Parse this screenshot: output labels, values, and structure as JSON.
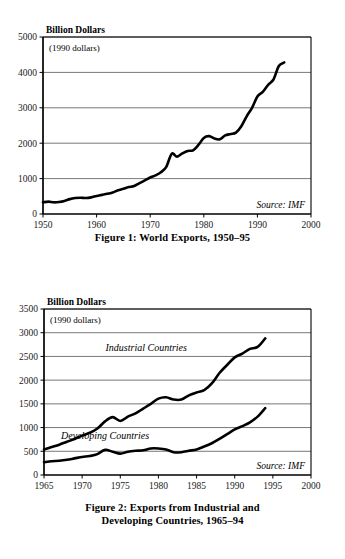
{
  "page": {
    "background": "#ffffff",
    "ink": "#000000",
    "gridline_color": "#555555",
    "line_color": "#000000"
  },
  "figures": [
    {
      "id": "figure-1",
      "caption": "Figure 1: World Exports, 1950–95",
      "chart_data": {
        "type": "line",
        "title": "",
        "ylabel": "Billion Dollars",
        "xlabel": "",
        "note": "(1990 dollars)",
        "source": "Source: IMF",
        "grid": true,
        "legend": "none",
        "xlim": [
          1950,
          2000
        ],
        "ylim": [
          0,
          5000
        ],
        "xticks": [
          1950,
          1960,
          1970,
          1980,
          1990,
          2000
        ],
        "yticks": [
          0,
          1000,
          2000,
          3000,
          4000,
          5000
        ],
        "series": [
          {
            "name": "World Exports",
            "x": [
              1950,
              1951,
              1952,
              1953,
              1954,
              1955,
              1956,
              1957,
              1958,
              1959,
              1960,
              1961,
              1962,
              1963,
              1964,
              1965,
              1966,
              1967,
              1968,
              1969,
              1970,
              1971,
              1972,
              1973,
              1974,
              1975,
              1976,
              1977,
              1978,
              1979,
              1980,
              1981,
              1982,
              1983,
              1984,
              1985,
              1986,
              1987,
              1988,
              1989,
              1990,
              1991,
              1992,
              1993,
              1994,
              1995
            ],
            "values": [
              330,
              350,
              330,
              340,
              370,
              420,
              450,
              460,
              450,
              470,
              510,
              540,
              570,
              610,
              670,
              710,
              760,
              790,
              870,
              950,
              1030,
              1090,
              1180,
              1330,
              1700,
              1620,
              1710,
              1780,
              1800,
              1950,
              2150,
              2200,
              2130,
              2110,
              2220,
              2260,
              2300,
              2480,
              2760,
              3000,
              3320,
              3450,
              3650,
              3800,
              4180,
              4280
            ]
          }
        ]
      }
    },
    {
      "id": "figure-2",
      "caption_line_1": "Figure 2: Exports from Industrial and",
      "caption_line_2": "Developing Countries, 1965–94",
      "chart_data": {
        "type": "line",
        "title": "",
        "ylabel": "Billion Dollars",
        "xlabel": "",
        "note": "(1990 dollars)",
        "source": "Source: IMF",
        "grid": true,
        "legend": "inline-labels",
        "xlim": [
          1965,
          2000
        ],
        "ylim": [
          0,
          3500
        ],
        "xticks": [
          1965,
          1970,
          1975,
          1980,
          1985,
          1990,
          1995,
          2000
        ],
        "yticks": [
          0,
          500,
          1000,
          1500,
          2000,
          2500,
          3000,
          3500
        ],
        "series": [
          {
            "name": "Industrial Countries",
            "label_x": 1978.4,
            "label_y": 2620,
            "x": [
              1965,
              1966,
              1967,
              1968,
              1969,
              1970,
              1971,
              1972,
              1973,
              1974,
              1975,
              1976,
              1977,
              1978,
              1979,
              1980,
              1981,
              1982,
              1983,
              1984,
              1985,
              1986,
              1987,
              1988,
              1989,
              1990,
              1991,
              1992,
              1993,
              1994
            ],
            "values": [
              540,
              590,
              640,
              700,
              760,
              830,
              890,
              980,
              1130,
              1220,
              1140,
              1230,
              1300,
              1400,
              1500,
              1610,
              1640,
              1590,
              1590,
              1680,
              1740,
              1790,
              1930,
              2150,
              2320,
              2480,
              2560,
              2660,
              2700,
              2880
            ]
          },
          {
            "name": "Developing Countries",
            "label_x": 1973.0,
            "label_y": 760,
            "x": [
              1965,
              1966,
              1967,
              1968,
              1969,
              1970,
              1971,
              1972,
              1973,
              1974,
              1975,
              1976,
              1977,
              1978,
              1979,
              1980,
              1981,
              1982,
              1983,
              1984,
              1985,
              1986,
              1987,
              1988,
              1989,
              1990,
              1991,
              1992,
              1993,
              1994
            ],
            "values": [
              270,
              290,
              300,
              320,
              350,
              380,
              400,
              440,
              530,
              490,
              450,
              490,
              510,
              520,
              560,
              560,
              540,
              480,
              480,
              510,
              540,
              600,
              670,
              760,
              860,
              960,
              1030,
              1110,
              1230,
              1410
            ]
          }
        ]
      }
    }
  ]
}
